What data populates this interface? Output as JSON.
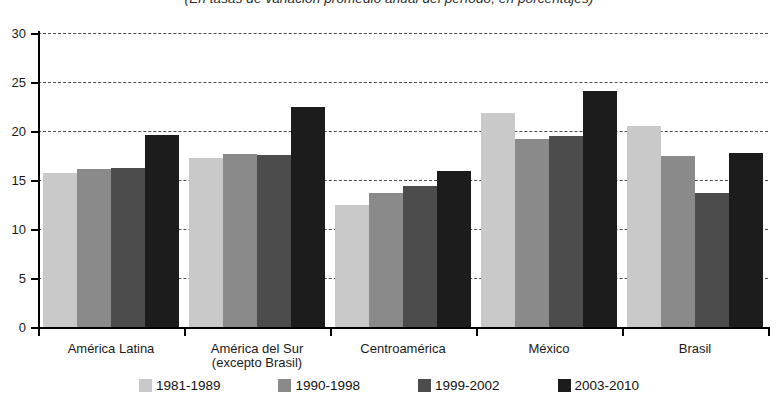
{
  "chart_data": {
    "type": "bar",
    "title": "",
    "subtitle": "(En tasas de variación promedio anual del período, en porcentajes)",
    "xlabel": "",
    "ylabel": "",
    "ylim": [
      0,
      30
    ],
    "ytick_step": 5,
    "yticks": [
      0,
      5,
      10,
      15,
      20,
      25,
      30
    ],
    "ytick_labels": [
      "0",
      "5",
      "10",
      "15",
      "20",
      "25",
      "30"
    ],
    "grid": true,
    "grid_style": "dashed-horizontal",
    "legend_position": "bottom",
    "categories": [
      "América Latina",
      "América del Sur (excepto Brasil)",
      "Centroamérica",
      "México",
      "Brasil"
    ],
    "category_lines": [
      [
        "América Latina"
      ],
      [
        "América del Sur",
        "(excepto Brasil)"
      ],
      [
        "Centroamérica"
      ],
      [
        "México"
      ],
      [
        "Brasil"
      ]
    ],
    "series": [
      {
        "name": "1981-1989",
        "color": "#c9c9c9",
        "values": [
          15.7,
          17.2,
          12.4,
          21.8,
          20.5
        ]
      },
      {
        "name": "1990-1998",
        "color": "#8a8a8a",
        "values": [
          16.1,
          17.7,
          13.7,
          19.2,
          17.4
        ]
      },
      {
        "name": "1999-2002",
        "color": "#4c4c4c",
        "values": [
          16.2,
          17.6,
          14.4,
          19.5,
          13.7
        ]
      },
      {
        "name": "2003-2010",
        "color": "#1c1c1c",
        "values": [
          19.6,
          22.4,
          15.9,
          24.1,
          17.8
        ]
      }
    ]
  }
}
